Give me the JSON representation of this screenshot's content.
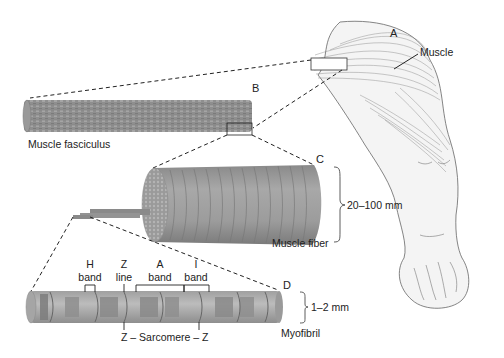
{
  "diagram": {
    "labels": {
      "A": "A",
      "B": "B",
      "C": "C",
      "D": "D",
      "muscle": "Muscle",
      "muscle_fasciculus": "Muscle fasciculus",
      "muscle_fiber": "Muscle fiber",
      "myofibril": "Myofibril",
      "fiber_size": "20–100 mm",
      "myofibril_size": "1–2 mm",
      "h_band_1": "H",
      "h_band_2": "band",
      "z_line_1": "Z",
      "z_line_2": "line",
      "a_band_1": "A",
      "a_band_2": "band",
      "i_band_1": "I",
      "i_band_2": "band",
      "sarcomere": "Z – Sarcomere – Z"
    },
    "colors": {
      "tissue": "#9a9a9a",
      "tissue_dark": "#6e6e6e",
      "tissue_light": "#bdbdbd",
      "skin": "#f2f2f2",
      "outline": "#555555",
      "dash": "#222222"
    }
  }
}
